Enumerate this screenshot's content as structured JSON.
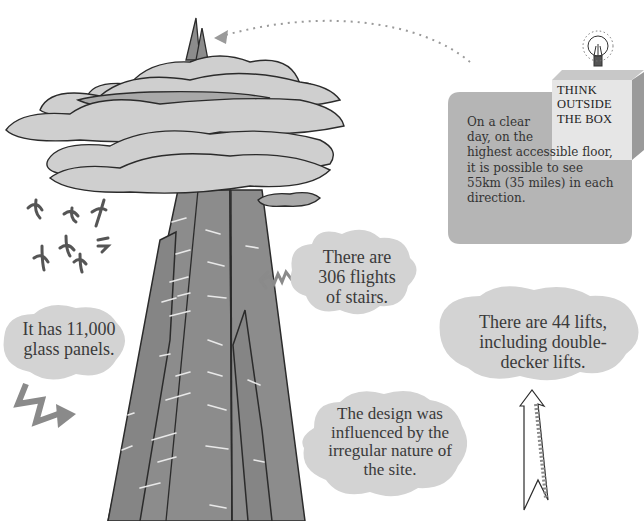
{
  "illustration": {
    "subject": "tall glass skyscraper rising through clouds",
    "colors": {
      "tower": "#8c8c8c",
      "tower_outline": "#2b2b2b",
      "cloud": "#cfcfcf",
      "cloud_dark": "#a9a9a9",
      "bubble": "#d3d3d3",
      "tip_panel": "#b5b5b5",
      "box_face": "#e6e6e6",
      "box_side": "#9a9a9a",
      "arrow": "#8a8a8a",
      "birds": "#555555",
      "window_dash": "#e8e8e8"
    }
  },
  "facts": {
    "stairs": [
      "There are",
      "306 flights",
      "of stairs."
    ],
    "panels": [
      "It has 11,000",
      "glass panels."
    ],
    "lifts": [
      "There are 44 lifts,",
      "including double-",
      "decker lifts."
    ],
    "design": [
      "The design was",
      "influenced by the",
      "irregular nature of",
      "the site."
    ]
  },
  "tip": {
    "box_label": [
      "THINK",
      "OUTSIDE",
      "THE BOX"
    ],
    "icon": "lightbulb-icon",
    "text_lines": [
      "On a clear",
      "day, on the",
      "highest accessible floor,",
      "it is possible to see",
      "55km (35 miles) in each",
      "direction."
    ]
  }
}
